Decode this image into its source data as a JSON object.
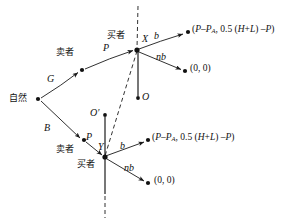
{
  "figure": {
    "type": "game-tree",
    "width": 307,
    "height": 221,
    "background": "#ffffff",
    "stroke": "#1a1a1a"
  },
  "nodes": [
    {
      "id": "nature",
      "name": "nature-node",
      "label": "自然",
      "x": 38,
      "y": 99,
      "label_x": 10,
      "label_y": 94
    },
    {
      "id": "seller_top",
      "name": "seller-top-node",
      "label": "卖者",
      "x": 82,
      "y": 70,
      "label_x": 58,
      "label_y": 51
    },
    {
      "id": "buyer_x",
      "name": "buyer-x-node",
      "label": "买者",
      "x": 137,
      "y": 50,
      "label_x": 108,
      "label_y": 31
    },
    {
      "id": "seller_bot",
      "name": "seller-bottom-node",
      "label": "卖者",
      "x": 84,
      "y": 140,
      "label_x": 58,
      "label_y": 147
    },
    {
      "id": "buyer_y",
      "name": "buyer-y-node",
      "label": "买者",
      "x": 105,
      "y": 157,
      "label_x": 60,
      "label_y": 160
    },
    {
      "id": "o_top",
      "name": "o-top-node",
      "label": "O",
      "x": 138,
      "y": 98,
      "label_x": 143,
      "label_y": 93
    },
    {
      "id": "o_bottom",
      "name": "o-prime-node",
      "label": "O′",
      "x": 105,
      "y": 115,
      "label_x": 91,
      "label_y": 110
    },
    {
      "id": "end_top_1",
      "name": "terminal-top-high",
      "label": "",
      "x": 187,
      "y": 33,
      "label_x": 0,
      "label_y": 0
    },
    {
      "id": "end_top_2",
      "name": "terminal-top-low",
      "label": "",
      "x": 185,
      "y": 71,
      "label_x": 0,
      "label_y": 0
    },
    {
      "id": "end_bot_1",
      "name": "terminal-bottom-high",
      "label": "",
      "x": 148,
      "y": 141,
      "label_x": 0,
      "label_y": 0
    },
    {
      "id": "end_bot_2",
      "name": "terminal-bottom-low",
      "label": "",
      "x": 148,
      "y": 183,
      "label_x": 0,
      "label_y": 0
    }
  ],
  "edge_labels": {
    "nature_good": "G",
    "nature_bad": "B",
    "price_top": "P",
    "price_bottom": "P",
    "buy_top": "b",
    "notbuy_top": "nb",
    "buy_bottom": "b",
    "notbuy_bottom": "nb"
  },
  "node_markers": {
    "x_label": "X",
    "y_label": "Y",
    "o_label": "O",
    "o_prime_label": "O′"
  },
  "payoffs": {
    "top_buy": {
      "open": "(",
      "first_a": "P",
      "minus": "–",
      "first_b": "P",
      "first_sub": "A",
      "comma": ", ",
      "coef": "0.5",
      "bracket_open": "(",
      "h": "H",
      "plus": "+",
      "l": "L",
      "bracket_close": ")",
      "minus2": " –",
      "p": "P",
      "close": ")",
      "full_text": "(P–P_A, 0.5 (H+L) –P)"
    },
    "top_notbuy": "(0, 0)",
    "bottom_buy": {
      "full_text": "(P–P_A, 0.5 (H+L) –P)"
    },
    "bottom_notbuy": "(0, 0)"
  },
  "labels": {
    "nature": "自然",
    "seller_top": "卖者",
    "seller_bottom": "卖者",
    "buyer_top": "买者",
    "buyer_bottom": "买者",
    "G": "G",
    "B": "B",
    "P_top": "P",
    "P_bottom": "P",
    "b_top": "b",
    "nb_top": "nb",
    "b_bottom": "b",
    "nb_bottom": "nb",
    "X": "X",
    "Y": "Y",
    "O": "O",
    "O_prime": "O′",
    "zero_top": "(0, 0)",
    "zero_bottom": "(0, 0)"
  }
}
